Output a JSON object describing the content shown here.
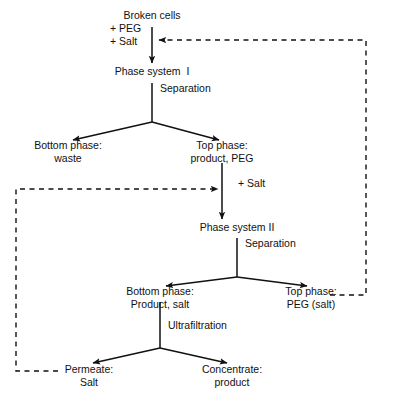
{
  "diagram": {
    "type": "process-flowchart",
    "colors": {
      "background": "#ffffff",
      "line": "#111111",
      "text": "#111111"
    },
    "nodes": [
      {
        "id": "broken-cells",
        "label": "Broken cells",
        "x": 152,
        "y": 15,
        "align": "center"
      },
      {
        "id": "additive-peg-salt",
        "label": "+ PEG\n+ Salt",
        "x": 110,
        "y": 28,
        "align": "left"
      },
      {
        "id": "phase-system-1",
        "label": "Phase system  I",
        "x": 152,
        "y": 71,
        "align": "center"
      },
      {
        "id": "separation-1",
        "label": "Separation",
        "x": 160,
        "y": 88,
        "align": "left"
      },
      {
        "id": "bottom-phase-1",
        "label": "Bottom phase:\nwaste",
        "x": 68,
        "y": 144,
        "align": "center"
      },
      {
        "id": "top-phase-1",
        "label": "Top phase:\nproduct, PEG",
        "x": 222,
        "y": 144,
        "align": "center"
      },
      {
        "id": "additive-salt",
        "label": "+ Salt",
        "x": 238,
        "y": 183,
        "align": "left"
      },
      {
        "id": "phase-system-2",
        "label": "Phase system II",
        "x": 237,
        "y": 227,
        "align": "center"
      },
      {
        "id": "separation-2",
        "label": "Separation",
        "x": 245,
        "y": 243,
        "align": "left"
      },
      {
        "id": "bottom-phase-2",
        "label": "Bottom phase:\nProduct, salt",
        "x": 160,
        "y": 290,
        "align": "center"
      },
      {
        "id": "top-phase-2",
        "label": "Top phase:\nPEG (salt)",
        "x": 311,
        "y": 290,
        "align": "center"
      },
      {
        "id": "ultrafiltration",
        "label": "Ultrafiltration",
        "x": 168,
        "y": 325,
        "align": "left"
      },
      {
        "id": "permeate",
        "label": "Permeate:\nSalt",
        "x": 89,
        "y": 368,
        "align": "center"
      },
      {
        "id": "concentrate",
        "label": "Concentrate:\nproduct",
        "x": 232,
        "y": 368,
        "align": "center"
      }
    ],
    "edges": [
      {
        "id": "edge-brokencells-to-ps1",
        "kind": "solid",
        "from": "broken-cells",
        "to": "phase-system-1"
      },
      {
        "id": "edge-ps1-to-bottom1",
        "kind": "solid",
        "from": "phase-system-1",
        "to": "bottom-phase-1"
      },
      {
        "id": "edge-ps1-to-top1",
        "kind": "solid",
        "from": "phase-system-1",
        "to": "top-phase-1"
      },
      {
        "id": "edge-top1-to-ps2",
        "kind": "solid",
        "from": "top-phase-1",
        "to": "phase-system-2"
      },
      {
        "id": "edge-ps2-to-bottom2",
        "kind": "solid",
        "from": "phase-system-2",
        "to": "bottom-phase-2"
      },
      {
        "id": "edge-ps2-to-top2",
        "kind": "solid",
        "from": "phase-system-2",
        "to": "top-phase-2"
      },
      {
        "id": "edge-bottom2-to-permeate",
        "kind": "solid",
        "from": "bottom-phase-2",
        "to": "permeate"
      },
      {
        "id": "edge-bottom2-to-conc",
        "kind": "solid",
        "from": "bottom-phase-2",
        "to": "concentrate"
      },
      {
        "id": "edge-recycle-peg",
        "kind": "dashed",
        "from": "top-phase-2",
        "to": "additive-peg-salt",
        "note": "PEG recycle loop, right side"
      },
      {
        "id": "edge-recycle-salt",
        "kind": "dashed",
        "from": "permeate",
        "to": "additive-salt",
        "note": "Salt recycle loop, left side"
      }
    ]
  }
}
